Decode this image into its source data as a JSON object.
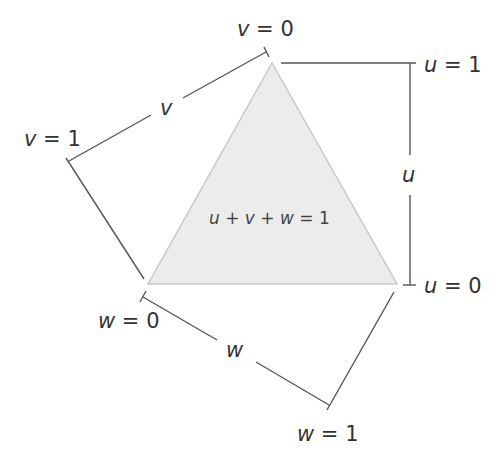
{
  "diagram": {
    "equation": "u + v + w = 1",
    "colors": {
      "triangle_fill": "#ececec",
      "triangle_stroke": "#c8c8c8",
      "line": "#555555",
      "text": "#333333"
    },
    "triangle": {
      "vertices": [
        [
          272,
          63
        ],
        [
          148,
          284
        ],
        [
          397,
          284
        ]
      ]
    },
    "axes": {
      "u": {
        "label": "u",
        "start_label": "u = 0",
        "end_label": "u = 1"
      },
      "v": {
        "label": "v",
        "start_label": "v = 0",
        "end_label": "v = 1"
      },
      "w": {
        "label": "w",
        "start_label": "w = 0",
        "end_label": "w = 1"
      }
    }
  }
}
